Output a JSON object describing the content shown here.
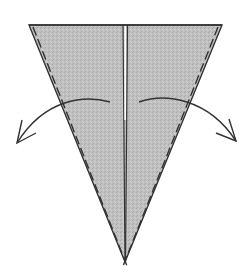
{
  "diagram": {
    "type": "origami-fold-step",
    "description": "Kite/triangle shape with center crease; both flaps folded outward",
    "colors": {
      "paper_fill": "#bdbdbd",
      "stroke": "#333333",
      "background": "#ffffff"
    },
    "shape": {
      "top_left": [
        29,
        25
      ],
      "top_right": [
        222,
        25
      ],
      "apex": [
        125,
        262
      ],
      "center_x": 125
    },
    "arrows": [
      {
        "name": "left-fold-arrow",
        "direction": "left",
        "start": [
          108,
          102
        ],
        "end": [
          17,
          143
        ]
      },
      {
        "name": "right-fold-arrow",
        "direction": "right",
        "start": [
          140,
          102
        ],
        "end": [
          236,
          141
        ]
      }
    ],
    "edges": {
      "style": "dashed-valley-fold-outer-edges"
    }
  }
}
